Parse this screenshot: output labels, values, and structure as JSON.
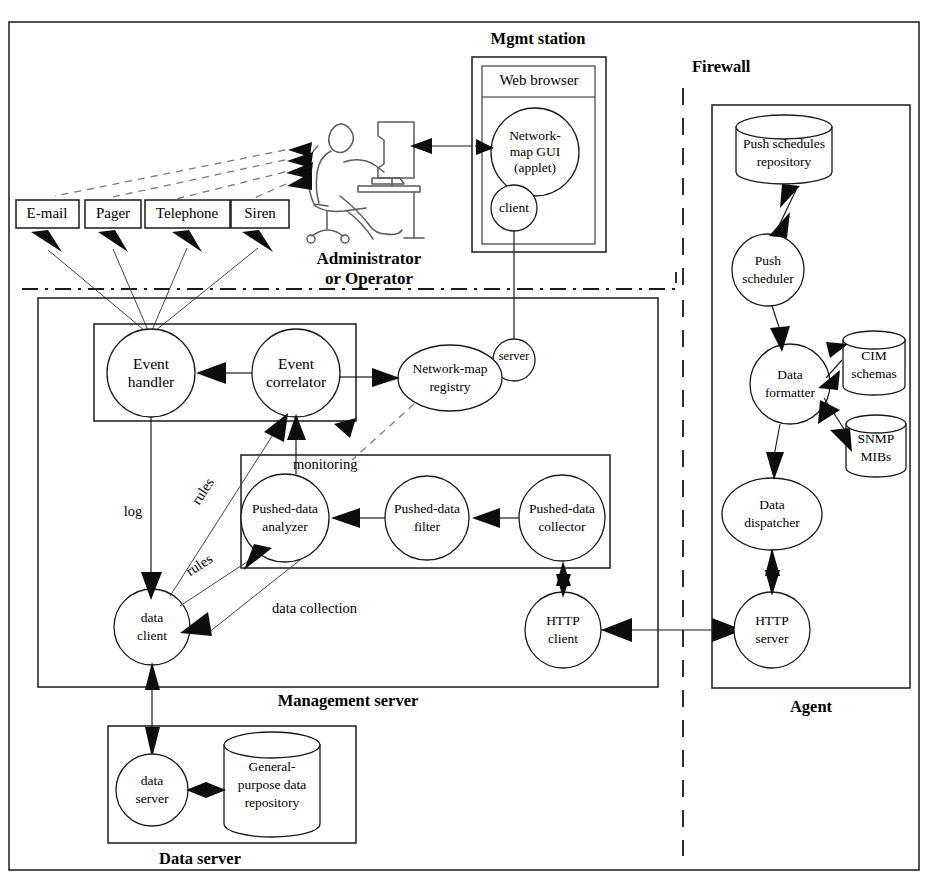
{
  "diagram": {
    "outer_frame": "outer-frame"
  },
  "regions": {
    "mgmt_station": {
      "label": "Mgmt station"
    },
    "web_browser": {
      "label": "Web browser"
    },
    "firewall": {
      "label": "Firewall"
    },
    "agent": {
      "label": "Agent"
    },
    "management_server": {
      "label": "Management server"
    },
    "data_server": {
      "label": "Data server"
    },
    "administrator": {
      "line1": "Administrator",
      "line2": "or Operator"
    }
  },
  "alerts": [
    {
      "label": "E-mail"
    },
    {
      "label": "Pager"
    },
    {
      "label": "Telephone"
    },
    {
      "label": "Siren"
    }
  ],
  "nodes": {
    "network_map_gui": {
      "line1": "Network-",
      "line2": "map GUI",
      "line3": "(applet)"
    },
    "client": {
      "label": "client"
    },
    "server": {
      "label": "server"
    },
    "event_handler": {
      "line1": "Event",
      "line2": "handler"
    },
    "event_correlator": {
      "line1": "Event",
      "line2": "correlator"
    },
    "network_map_registry": {
      "line1": "Network-map",
      "line2": "registry"
    },
    "pushed_data_analyzer": {
      "line1": "Pushed-data",
      "line2": "analyzer"
    },
    "pushed_data_filter": {
      "line1": "Pushed-data",
      "line2": "filter"
    },
    "pushed_data_collector": {
      "line1": "Pushed-data",
      "line2": "collector"
    },
    "data_client": {
      "line1": "data",
      "line2": "client"
    },
    "http_client": {
      "line1": "HTTP",
      "line2": "client"
    },
    "data_server_node": {
      "line1": "data",
      "line2": "server"
    },
    "general_repository": {
      "line1": "General-",
      "line2": "purpose data",
      "line3": "repository"
    },
    "push_schedules_repository": {
      "line1": "Push schedules",
      "line2": "repository"
    },
    "push_scheduler": {
      "line1": "Push",
      "line2": "scheduler"
    },
    "data_formatter": {
      "line1": "Data",
      "line2": "formatter"
    },
    "cim_schemas": {
      "line1": "CIM",
      "line2": "schemas"
    },
    "snmp_mibs": {
      "line1": "SNMP",
      "line2": "MIBs"
    },
    "data_dispatcher": {
      "line1": "Data",
      "line2": "dispatcher"
    },
    "http_server": {
      "line1": "HTTP",
      "line2": "server"
    }
  },
  "edge_labels": {
    "log": "log",
    "rules_upper": "rules",
    "rules_lower": "rules",
    "monitoring": "monitoring",
    "data_collection": "data collection"
  },
  "colors": {
    "stroke": "#1a1a1a",
    "fill": "#ffffff",
    "arrow": "#0d0d0d",
    "soft": "#7a7a7a",
    "person": "#5a5a5a"
  }
}
